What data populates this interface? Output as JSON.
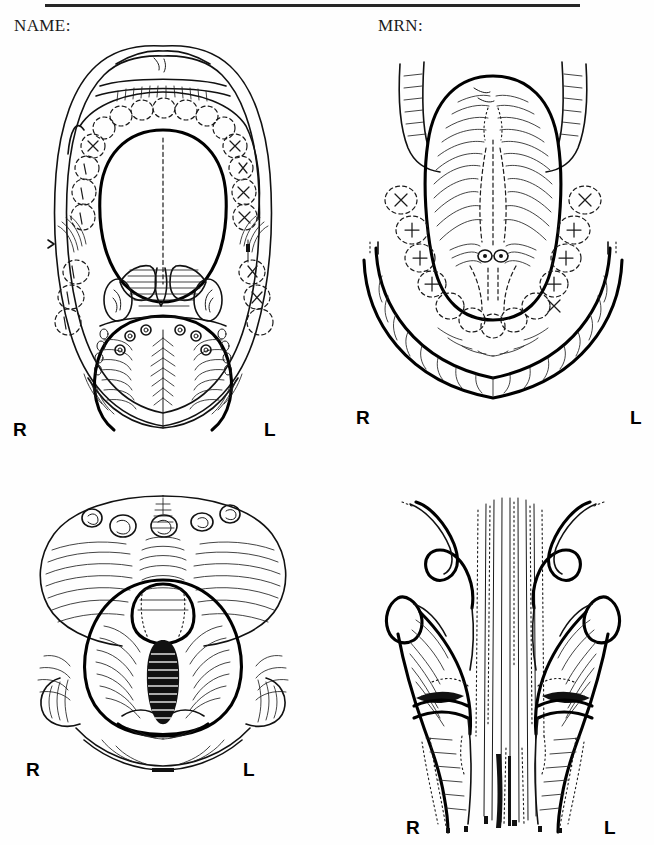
{
  "form": {
    "name_label": "NAME:",
    "mrn_label": "MRN:"
  },
  "side_markers": {
    "right": "R",
    "left": "L"
  },
  "figures": [
    {
      "id": "oral-cavity",
      "view": "Open mouth / oral cavity and oropharynx",
      "structures": [
        "lips",
        "hard palate",
        "soft palate",
        "uvula",
        "maxillary dental arch",
        "mandibular dental arch",
        "palatine tonsil right",
        "palatine tonsil left",
        "anterior tonsillar pillar",
        "posterior tonsillar pillar",
        "tongue dorsum",
        "median sulcus",
        "circumvallate papillae",
        "buccal mucosa"
      ],
      "markers": {
        "right": "R",
        "left": "L"
      }
    },
    {
      "id": "floor-of-mouth",
      "view": "Ventral tongue / floor of mouth",
      "structures": [
        "ventral tongue surface",
        "lingual frenulum",
        "submandibular duct orifices",
        "sublingual folds",
        "lower lip",
        "mandibular dental arch",
        "lateral tongue border right",
        "lateral tongue border left"
      ],
      "markers": {
        "right": "R",
        "left": "L"
      }
    },
    {
      "id": "larynx",
      "view": "Laryngoscopic view of larynx",
      "structures": [
        "tongue base",
        "circumvallate papillae",
        "vallecula",
        "epiglottis",
        "true vocal cords",
        "false vocal cords",
        "glottis",
        "subglottis and trachea",
        "aryepiglottic fold right",
        "aryepiglottic fold left",
        "arytenoid right",
        "arytenoid left",
        "posterior commissure"
      ],
      "markers": {
        "right": "R",
        "left": "L"
      }
    },
    {
      "id": "hypopharynx",
      "view": "Hypopharynx and pyriform sinuses",
      "structures": [
        "pyriform sinus right",
        "pyriform sinus left",
        "aryepiglottic fold right",
        "aryepiglottic fold left",
        "arytenoid right",
        "arytenoid left",
        "postcricoid region",
        "posterior pharyngeal wall",
        "cervical esophagus inlet"
      ],
      "markers": {
        "right": "R",
        "left": "L"
      }
    }
  ]
}
